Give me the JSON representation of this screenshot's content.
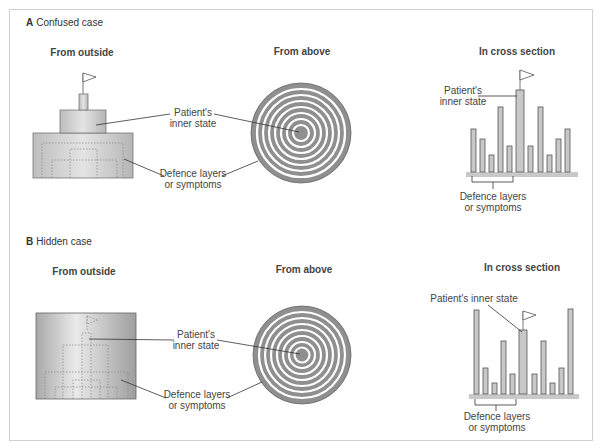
{
  "figure": {
    "panels": [
      {
        "letter": "A",
        "title": "Confused case",
        "views": {
          "outside": "From outside",
          "above": "From above",
          "cross": "In cross section"
        },
        "labels": {
          "inner_outside_l1": "Patient's",
          "inner_outside_l2": "inner state",
          "defence_outside_l1": "Defence layers",
          "defence_outside_l2": "or symptoms",
          "inner_cross_l1": "Patient's",
          "inner_cross_l2": "inner state",
          "defence_cross_l1": "Defence layers",
          "defence_cross_l2": "or symptoms"
        },
        "cross_section_bar_heights": [
          45,
          35,
          20,
          62,
          26,
          80,
          26,
          62,
          20,
          35,
          45
        ]
      },
      {
        "letter": "B",
        "title": "Hidden case",
        "views": {
          "outside": "From outside",
          "above": "From above",
          "cross": "In cross section"
        },
        "labels": {
          "inner_outside_l1": "Patient's",
          "inner_outside_l2": "inner state",
          "defence_outside_l1": "Defence layers",
          "defence_outside_l2": "or symptoms",
          "inner_cross_l1": "Patient's inner state",
          "defence_cross_l1": "Defence layers",
          "defence_cross_l2": "or symptoms"
        },
        "cross_section_bar_heights": [
          84,
          26,
          11,
          53,
          20,
          64,
          20,
          53,
          11,
          26,
          85
        ]
      }
    ],
    "colors": {
      "bar_fill": "#c8c8c8",
      "bar_stroke": "#555555",
      "ring_dark": "#8f8f8f",
      "ring_light": "#ffffff",
      "base_fill": "#c9c9c9",
      "tower_fill": "#cfcfcf",
      "leader_line": "#333333"
    }
  }
}
